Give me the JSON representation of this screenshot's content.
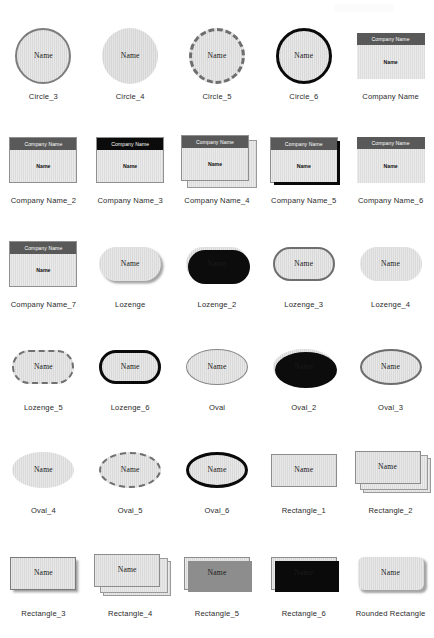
{
  "page": {
    "background": "#ffffff",
    "shape_fill": "#d9d9d9",
    "shape_border_grey": "#7d7d7d",
    "shape_border_black": "#0a0a0a",
    "card_header_grey": "#595959",
    "card_header_black": "#0b0b0b",
    "label_color": "#2b2b2b",
    "name_text": "Name",
    "company_text": "Company Name"
  },
  "rows": [
    {
      "cells": [
        {
          "label": "Circle_3",
          "shape": "circle",
          "style": "solid-grey-border",
          "name": "Name"
        },
        {
          "label": "Circle_4",
          "shape": "circle",
          "style": "no-border",
          "name": "Name"
        },
        {
          "label": "Circle_5",
          "shape": "circle",
          "style": "dashed-grey-border",
          "name": "Name"
        },
        {
          "label": "Circle_6",
          "shape": "circle",
          "style": "thick-black-border",
          "name": "Name"
        },
        {
          "label": "Company Name",
          "shape": "card",
          "style": "grey-header",
          "name": "Name",
          "header": "Company Name"
        }
      ]
    },
    {
      "cells": [
        {
          "label": "Company Name_2",
          "shape": "card",
          "style": "grey-header-bordered",
          "name": "Name",
          "header": "Company Name"
        },
        {
          "label": "Company Name_3",
          "shape": "card",
          "style": "black-header-bordered",
          "name": "Name",
          "header": "Company Name"
        },
        {
          "label": "Company Name_4",
          "shape": "card",
          "style": "grey-header-stacked",
          "name": "Name",
          "header": "Company Name"
        },
        {
          "label": "Company Name_5",
          "shape": "card",
          "style": "grey-header-black-shadow",
          "name": "Name",
          "header": "Company Name"
        },
        {
          "label": "Company Name_6",
          "shape": "card",
          "style": "grey-header-plain",
          "name": "Name",
          "header": "Company Name"
        }
      ]
    },
    {
      "cells": [
        {
          "label": "Company Name_7",
          "shape": "card",
          "style": "grey-header-bordered",
          "name": "Name",
          "header": "Company Name"
        },
        {
          "label": "Lozenge",
          "shape": "lozenge",
          "style": "soft-grey-shadow",
          "name": "Name"
        },
        {
          "label": "Lozenge_2",
          "shape": "lozenge",
          "style": "hard-black-shadow",
          "name": "Name"
        },
        {
          "label": "Lozenge_3",
          "shape": "lozenge",
          "style": "medium-grey-border",
          "name": "Name"
        },
        {
          "label": "Lozenge_4",
          "shape": "lozenge",
          "style": "no-border",
          "name": "Name"
        }
      ]
    },
    {
      "cells": [
        {
          "label": "Lozenge_5",
          "shape": "lozenge",
          "style": "dashed-grey-border",
          "name": "Name"
        },
        {
          "label": "Lozenge_6",
          "shape": "lozenge",
          "style": "thick-black-border",
          "name": "Name"
        },
        {
          "label": "Oval",
          "shape": "oval",
          "style": "thin-grey-border",
          "name": "Name"
        },
        {
          "label": "Oval_2",
          "shape": "oval",
          "style": "hard-black-shadow",
          "name": "Name"
        },
        {
          "label": "Oval_3",
          "shape": "oval",
          "style": "medium-grey-border",
          "name": "Name"
        }
      ]
    },
    {
      "cells": [
        {
          "label": "Oval_4",
          "shape": "oval",
          "style": "no-border",
          "name": "Name"
        },
        {
          "label": "Oval_5",
          "shape": "oval",
          "style": "dashed-grey-border",
          "name": "Name"
        },
        {
          "label": "Oval_6",
          "shape": "oval",
          "style": "thick-black-border",
          "name": "Name"
        },
        {
          "label": "Rectangle_1",
          "shape": "rectangle",
          "style": "thin-grey-border",
          "name": "Name"
        },
        {
          "label": "Rectangle_2",
          "shape": "rectangle",
          "style": "stacked-three",
          "name": "Name"
        }
      ]
    },
    {
      "cells": [
        {
          "label": "Rectangle_3",
          "shape": "rectangle",
          "style": "soft-grey-shadow",
          "name": "Name"
        },
        {
          "label": "Rectangle_4",
          "shape": "rectangle",
          "style": "stacked-three",
          "name": "Name"
        },
        {
          "label": "Rectangle_5",
          "shape": "rectangle",
          "style": "grey-offset-shadow",
          "name": "Name"
        },
        {
          "label": "Rectangle_6",
          "shape": "rectangle",
          "style": "black-offset-shadow",
          "name": "Name"
        },
        {
          "label": "Rounded Rectangle",
          "shape": "rectangle",
          "style": "rounded-soft-shadow",
          "name": "Name"
        }
      ]
    }
  ]
}
